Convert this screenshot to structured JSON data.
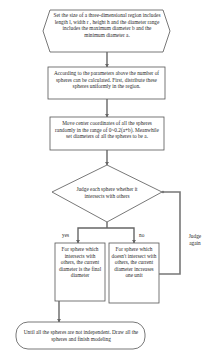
{
  "diagram": {
    "type": "flowchart",
    "colors": {
      "stroke": "#555555",
      "connector": "#666666",
      "text": "#2a2a2a",
      "background": "#ffffff"
    },
    "nodes": [
      {
        "id": "start",
        "shape": "hexagon",
        "text": "Set the size of a three-dimensional region includes length l, width r , height h and the diameter range includes the maximum diameter b and the minimum diameter a."
      },
      {
        "id": "calc",
        "shape": "rectangle",
        "text": "According to the parameters above the number of spheres can be calculated. First, distribute these spheres uniformly in the region."
      },
      {
        "id": "move",
        "shape": "rectangle",
        "text": "Move center coordinates of all the spheres randomly in the range of 0~0.2(a+b). Meanwhile set diameters of all the spheres to be a."
      },
      {
        "id": "judge",
        "shape": "diamond",
        "text": "Judge each sphere whether it intersects with others"
      },
      {
        "id": "yes_box",
        "shape": "rectangle",
        "text": "For sphere which intersects with others, the current diameter is the final diameter"
      },
      {
        "id": "no_box",
        "shape": "rectangle",
        "text": "For sphere which doesn't intersect with others, the current diameter increases one unit"
      },
      {
        "id": "end",
        "shape": "terminator",
        "text": "Until all the spheres are not independent. Draw all the spheres and finish modeling"
      }
    ],
    "edges": [
      {
        "from": "start",
        "to": "calc",
        "label": ""
      },
      {
        "from": "calc",
        "to": "move",
        "label": ""
      },
      {
        "from": "move",
        "to": "judge",
        "label": ""
      },
      {
        "from": "judge",
        "to": "yes_box",
        "label": "yes"
      },
      {
        "from": "judge",
        "to": "no_box",
        "label": "no"
      },
      {
        "from": "no_box",
        "to": "judge",
        "label": "Judge again"
      },
      {
        "from": "yes_box",
        "to": "end",
        "label": ""
      }
    ],
    "labels": {
      "yes": "yes",
      "no": "no",
      "judge_again": "Judge again"
    }
  }
}
